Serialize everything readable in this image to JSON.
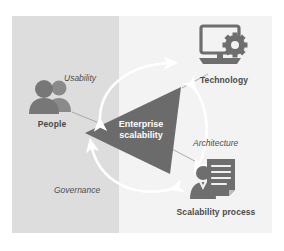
{
  "diagram": {
    "center": {
      "line1": "Enterprise",
      "line2": "scalability",
      "shape": "triangle",
      "fill": "#6b6b6b",
      "text_color": "#ffffff"
    },
    "nodes": [
      {
        "id": "people",
        "label": "People",
        "icon": "two-people-icon",
        "icon_color": "#7d7d7d",
        "position": "left"
      },
      {
        "id": "technology",
        "label": "Technology",
        "icon": "monitor-gear-icon",
        "icon_color": "#6e6e6e",
        "position": "top-right"
      },
      {
        "id": "scalability-process",
        "label": "Scalability process",
        "icon": "document-person-icon",
        "icon_color": "#6e6e6e",
        "position": "bottom-right"
      }
    ],
    "edges": [
      {
        "id": "usability",
        "label": "Usability",
        "from": "people",
        "to": "technology",
        "style": "double-headed-curved-arrow",
        "color": "#ffffff"
      },
      {
        "id": "architecture",
        "label": "Architecture",
        "from": "technology",
        "to": "scalability-process",
        "style": "double-headed-curved-arrow",
        "color": "#ffffff"
      },
      {
        "id": "governance",
        "label": "Governance",
        "from": "scalability-process",
        "to": "people",
        "style": "double-headed-curved-arrow",
        "color": "#ffffff"
      }
    ],
    "background": {
      "left_band_color": "#dddddd",
      "right_band_color": "#f3f3f3",
      "page_color": "#ffffff"
    }
  }
}
